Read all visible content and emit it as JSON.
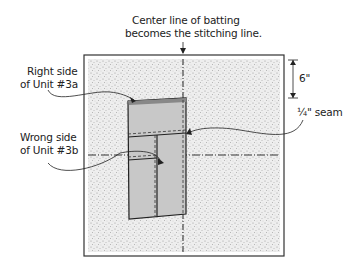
{
  "title": {
    "line1": "Center line of batting",
    "line2": "becomes the stitching line."
  },
  "labels": {
    "unit3a_line1": "Right side",
    "unit3a_line2": "of Unit #3a",
    "unit3b_line1": "Wrong side",
    "unit3b_line2": "of Unit #3b",
    "seam": "¼\" seam",
    "dimension": "6\""
  },
  "colors": {
    "batting": "#e6e6e6",
    "fabric": "#c8c8c8",
    "line": "#222222"
  }
}
